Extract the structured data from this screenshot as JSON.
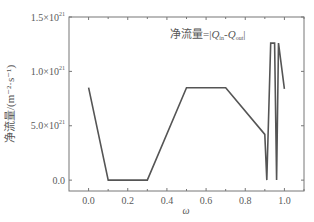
{
  "chart_data": {
    "type": "line",
    "title": "",
    "annotation": {
      "prefix": "净流量=|",
      "q_in": "Q",
      "q_in_sub": "in",
      "minus": "-",
      "q_out": "Q",
      "q_out_sub": "out",
      "suffix": "|"
    },
    "xlabel": "ω",
    "ylabel": "净流量/(m⁻²·s⁻¹)",
    "xlim": [
      -0.1,
      1.1
    ],
    "ylim": [
      -1e+20,
      1.5e+21
    ],
    "x_ticks": [
      {
        "value": 0.0,
        "label": "0.0"
      },
      {
        "value": 0.2,
        "label": "0.2"
      },
      {
        "value": 0.4,
        "label": "0.4"
      },
      {
        "value": 0.6,
        "label": "0.6"
      },
      {
        "value": 0.8,
        "label": "0.8"
      },
      {
        "value": 1.0,
        "label": "1.0"
      }
    ],
    "y_ticks": [
      {
        "value": 0.0,
        "label": "0.0",
        "exp": ""
      },
      {
        "value": 5e+20,
        "label": "5.0×10",
        "exp": "21"
      },
      {
        "value": 1e+21,
        "label": "1.0×10",
        "exp": "21"
      },
      {
        "value": 1.5e+21,
        "label": "1.5×10",
        "exp": "21"
      }
    ],
    "grid": false,
    "legend": null,
    "series": [
      {
        "name": "净流量",
        "color": "#555555",
        "x": [
          0.0,
          0.1,
          0.3,
          0.5,
          0.7,
          0.9,
          0.91,
          0.93,
          0.95,
          0.96,
          0.97,
          1.0
        ],
        "y": [
          8.5e+20,
          0.0,
          0.0,
          8.5e+20,
          8.5e+20,
          4.2e+20,
          0.0,
          1.26e+21,
          1.26e+21,
          0.0,
          1.26e+21,
          8.4e+20
        ]
      }
    ]
  }
}
